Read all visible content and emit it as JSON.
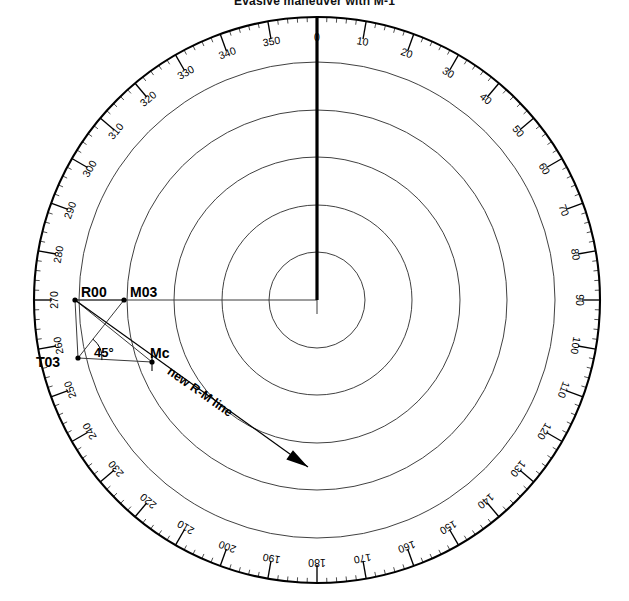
{
  "figure": {
    "title": "Evasive maneuver with M-1",
    "type": "polar-compass-diagram",
    "width": 629,
    "height": 601
  },
  "compass": {
    "center": {
      "x": 317,
      "y": 300
    },
    "outer_radius": 283,
    "label_radius": 263,
    "tick": {
      "major_deg": 10,
      "medium_deg": 5,
      "minor_deg": 2,
      "major_len": 18,
      "medium_len": 11,
      "minor_len": 5
    },
    "degree_labels": [
      "0",
      "10",
      "20",
      "30",
      "40",
      "50",
      "60",
      "70",
      "80",
      "90",
      "100",
      "110",
      "120",
      "130",
      "140",
      "150",
      "160",
      "170",
      "180",
      "190",
      "200",
      "210",
      "220",
      "230",
      "240",
      "250",
      "260",
      "270",
      "280",
      "290",
      "300",
      "310",
      "320",
      "330",
      "340",
      "350"
    ]
  },
  "range_rings": {
    "count": 5,
    "radii": [
      48,
      95,
      143,
      190,
      238
    ],
    "color": "#2b2b2b"
  },
  "bearing_line": {
    "label": "000-heading-line",
    "from_deg": 0,
    "length": 283,
    "stroke_width": 3.2,
    "color": "#000000"
  },
  "cross_hair": {
    "horizontal_from_deg": 270,
    "horizontal_length": 243,
    "color": "#3a3a3a"
  },
  "points": [
    {
      "id": "R00",
      "label": "R00",
      "x": 75,
      "y": 300,
      "label_dx": 6,
      "label_dy": -8
    },
    {
      "id": "M03",
      "label": "M03",
      "x": 124,
      "y": 300,
      "label_dx": 6,
      "label_dy": -8
    },
    {
      "id": "T03",
      "label": "T03",
      "x": 78,
      "y": 358,
      "label_dx": -42,
      "label_dy": 4
    },
    {
      "id": "Mc",
      "label": "Mc",
      "x": 152,
      "y": 362,
      "label_dx": -2,
      "label_dy": -9
    }
  ],
  "segments": [
    {
      "name": "R00-to-T03",
      "x1": 75,
      "y1": 300,
      "x2": 78,
      "y2": 358
    },
    {
      "name": "R00-to-Mc",
      "x1": 75,
      "y1": 300,
      "x2": 152,
      "y2": 362
    },
    {
      "name": "T03-to-M03",
      "x1": 78,
      "y1": 358,
      "x2": 124,
      "y2": 300
    },
    {
      "name": "T03-to-Mc",
      "x1": 78,
      "y1": 358,
      "x2": 152,
      "y2": 362
    },
    {
      "name": "R00-to-M03",
      "x1": 75,
      "y1": 300,
      "x2": 124,
      "y2": 300
    }
  ],
  "angle_annotation": {
    "label": "45°",
    "vertex": {
      "x": 78,
      "y": 358
    },
    "arc_radius": 24,
    "label_pos": {
      "x": 94,
      "y": 352
    }
  },
  "new_rm_line": {
    "label": "new R-M line",
    "x1": 75,
    "y1": 300,
    "x2": 308,
    "y2": 467,
    "label_anchor": {
      "x": 200,
      "y": 392
    },
    "label_rotation_deg": 35,
    "arrowhead": true
  },
  "colors": {
    "ink": "#000000",
    "ring": "#2b2b2b",
    "thin": "#3a3a3a",
    "background": "#ffffff"
  }
}
